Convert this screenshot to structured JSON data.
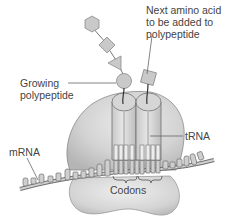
{
  "diagram": {
    "labels": {
      "next_amino_acid": [
        "Next amino acid",
        "to be added to",
        "polypeptide"
      ],
      "growing_polypeptide": [
        "Growing",
        "polypeptide"
      ],
      "trna": "tRNA",
      "mrna": "mRNA",
      "codons": "Codons"
    },
    "colors": {
      "fill_light": "#d9d9d9",
      "fill_mid": "#c4c4c4",
      "stroke": "#6e6e6e",
      "text": "#444444",
      "background": "#ffffff"
    },
    "components": [
      "hexagon amino acid",
      "diamond amino acid",
      "triangle amino acid",
      "circle amino acid",
      "square amino acid",
      "large ribosomal subunit",
      "small ribosomal subunit",
      "tRNA (x2)",
      "mRNA strand",
      "codons (x2)"
    ]
  }
}
